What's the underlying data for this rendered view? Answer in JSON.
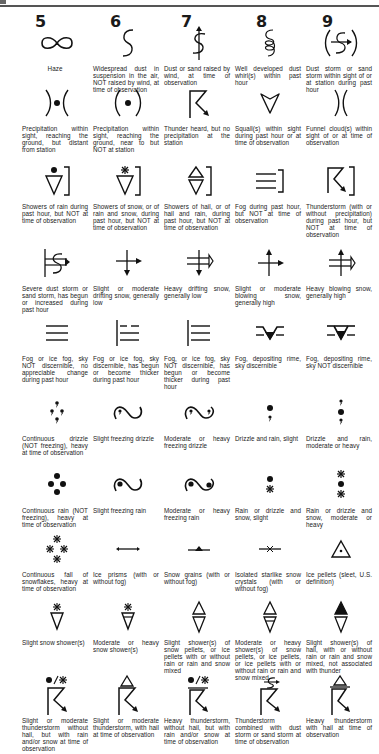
{
  "page": {
    "title_fragment": "",
    "column_headers": [
      "5",
      "6",
      "7",
      "8",
      "9"
    ]
  },
  "rows": [
    {
      "cells": [
        {
          "code": "05",
          "symbol": "haze-icon",
          "caption": "Haze"
        },
        {
          "code": "06",
          "symbol": "widespread-dust-icon",
          "caption": "Widespread dust in suspension in the air, NOT raised by wind, at time of observation"
        },
        {
          "code": "07",
          "symbol": "dust-raised-by-wind-icon",
          "caption": "Dust or sand raised by wind, at time of observation"
        },
        {
          "code": "08",
          "symbol": "dust-whirls-icon",
          "caption": "Well developed dust whirl(s) within past hour"
        },
        {
          "code": "09",
          "symbol": "dust-storm-in-sight-icon",
          "caption": "Dust storm or sand storm within sight of or at station during past hour"
        }
      ]
    },
    {
      "cells": [
        {
          "code": "15",
          "symbol": "precip-distant-icon",
          "caption": "Precipitation within sight, reaching the ground, but distant from station"
        },
        {
          "code": "16",
          "symbol": "precip-near-icon",
          "caption": "Precipitation within sight, reaching the ground, near to but NOT at station"
        },
        {
          "code": "17",
          "symbol": "thunder-heard-icon",
          "caption": "Thunder heard, but no precipitation at the station"
        },
        {
          "code": "18",
          "symbol": "squall-icon",
          "caption": "Squall(s) within sight during past hour or at time of observation"
        },
        {
          "code": "19",
          "symbol": "funnel-cloud-icon",
          "caption": "Funnel cloud(s) within sight of or at time of observation"
        }
      ]
    },
    {
      "cells": [
        {
          "code": "25",
          "symbol": "rain-showers-past-hour-icon",
          "caption": "Showers of rain during past hour, but NOT at time of observation"
        },
        {
          "code": "26",
          "symbol": "snow-showers-past-hour-icon",
          "caption": "Showers of snow, or of rain and snow, during past hour, but NOT at time of observation"
        },
        {
          "code": "27",
          "symbol": "hail-showers-past-hour-icon",
          "caption": "Showers of hail, or of hail and rain, during past hour, but NOT at time of observation"
        },
        {
          "code": "28",
          "symbol": "fog-past-hour-icon",
          "caption": "Fog during past hour, but NOT at time of observation"
        },
        {
          "code": "29",
          "symbol": "thunderstorm-past-hour-icon",
          "caption": "Thunderstorm (with or without precipitation) during past hour, but NOT at time of observation"
        }
      ]
    },
    {
      "cells": [
        {
          "code": "35",
          "symbol": "severe-dust-storm-icon",
          "caption": "Severe dust storm or sand storm, has begun or increased during past hour"
        },
        {
          "code": "36",
          "symbol": "drifting-snow-low-icon",
          "caption": "Slight or moderate drifting snow, generally low"
        },
        {
          "code": "37",
          "symbol": "heavy-drifting-snow-icon",
          "caption": "Heavy drifting snow, generally low"
        },
        {
          "code": "38",
          "symbol": "blowing-snow-high-icon",
          "caption": "Slight or moderate blowing snow, generally high"
        },
        {
          "code": "39",
          "symbol": "heavy-blowing-snow-icon",
          "caption": "Heavy blowing snow, generally high"
        }
      ]
    },
    {
      "cells": [
        {
          "code": "45",
          "symbol": "fog-sky-not-discernible-icon",
          "caption": "Fog or ice fog, sky NOT discernible, no appreciable change during past hour"
        },
        {
          "code": "46",
          "symbol": "fog-thickening-sky-visible-icon",
          "caption": "Fog or ice fog, sky discernible, has begun or become thicker during past hour"
        },
        {
          "code": "47",
          "symbol": "fog-thickening-sky-hidden-icon",
          "caption": "Fog, or ice fog, sky NOT discernible, has begun or become thicker during past hour"
        },
        {
          "code": "48",
          "symbol": "rime-fog-sky-visible-icon",
          "caption": "Fog, depositing rime, sky discernible"
        },
        {
          "code": "49",
          "symbol": "rime-fog-sky-hidden-icon",
          "caption": "Fog, depositing rime, sky NOT discernible"
        }
      ]
    },
    {
      "cells": [
        {
          "code": "55",
          "symbol": "heavy-drizzle-icon",
          "caption": "Continuous drizzle (NOT freezing), heavy at time of observation"
        },
        {
          "code": "56",
          "symbol": "slight-freezing-drizzle-icon",
          "caption": "Slight freezing drizzle"
        },
        {
          "code": "57",
          "symbol": "heavy-freezing-drizzle-icon",
          "caption": "Moderate or heavy freezing drizzle"
        },
        {
          "code": "58",
          "symbol": "drizzle-rain-slight-icon",
          "caption": "Drizzle and rain, slight"
        },
        {
          "code": "59",
          "symbol": "drizzle-rain-heavy-icon",
          "caption": "Drizzle and rain, moderate or heavy"
        }
      ]
    },
    {
      "cells": [
        {
          "code": "65",
          "symbol": "heavy-rain-icon",
          "caption": "Continuous rain (NOT freezing), heavy at time of observation"
        },
        {
          "code": "66",
          "symbol": "slight-freezing-rain-icon",
          "caption": "Slight freezing rain"
        },
        {
          "code": "67",
          "symbol": "heavy-freezing-rain-icon",
          "caption": "Moderate or heavy freezing rain"
        },
        {
          "code": "68",
          "symbol": "rain-snow-slight-icon",
          "caption": "Rain or drizzle and snow, slight"
        },
        {
          "code": "69",
          "symbol": "rain-snow-heavy-icon",
          "caption": "Rain or drizzle and snow, moderate or heavy"
        }
      ]
    },
    {
      "cells": [
        {
          "code": "75",
          "symbol": "heavy-snow-icon",
          "caption": "Continuous fall of snowflakes, heavy at time of observation"
        },
        {
          "code": "76",
          "symbol": "ice-prisms-icon",
          "caption": "Ice prisms (with or without fog)"
        },
        {
          "code": "77",
          "symbol": "snow-grains-icon",
          "caption": "Snow grains (with or without fog)"
        },
        {
          "code": "78",
          "symbol": "starlike-crystals-icon",
          "caption": "Isolated starlike snow crystals (with or without fog)"
        },
        {
          "code": "79",
          "symbol": "ice-pellets-icon",
          "caption": "Ice pellets (sleet, U.S. definition)"
        }
      ]
    },
    {
      "cells": [
        {
          "code": "85",
          "symbol": "slight-snow-showers-icon",
          "caption": "Slight snow shower(s)"
        },
        {
          "code": "86",
          "symbol": "heavy-snow-showers-icon",
          "caption": "Moderate or heavy snow shower(s)"
        },
        {
          "code": "87",
          "symbol": "slight-snow-pellet-showers-icon",
          "caption": "Slight shower(s) of snow pellets, or ice pellets with or without rain or rain and snow mixed"
        },
        {
          "code": "88",
          "symbol": "heavy-snow-pellet-showers-icon",
          "caption": "Moderate or heavy shower(s) of snow pellets, or ice pellets, or ice pellets with or without rain or rain and snow mixed"
        },
        {
          "code": "89",
          "symbol": "slight-hail-showers-icon",
          "caption": "Slight shower(s) of hail, with or without rain or rain and snow mixed, not associated with thunder"
        }
      ]
    },
    {
      "cells": [
        {
          "code": "95",
          "symbol": "thunderstorm-rain-snow-icon",
          "caption": "Slight or moderate thunderstorm without hail, but with rain and/or snow at time of observation"
        },
        {
          "code": "96",
          "symbol": "thunderstorm-hail-icon",
          "caption": "Slight or moderate thunderstorm, with hail at time of observation"
        },
        {
          "code": "97",
          "symbol": "heavy-thunderstorm-rain-snow-icon",
          "caption": "Heavy thunderstorm, without hail, but with rain and/or snow at time of observation"
        },
        {
          "code": "98",
          "symbol": "thunderstorm-dust-storm-icon",
          "caption": "Thunderstorm combined with dust storm or sand storm at time of observation"
        },
        {
          "code": "99",
          "symbol": "heavy-thunderstorm-hail-icon",
          "caption": "Heavy thunderstorm with hail at time of observation"
        }
      ]
    }
  ]
}
